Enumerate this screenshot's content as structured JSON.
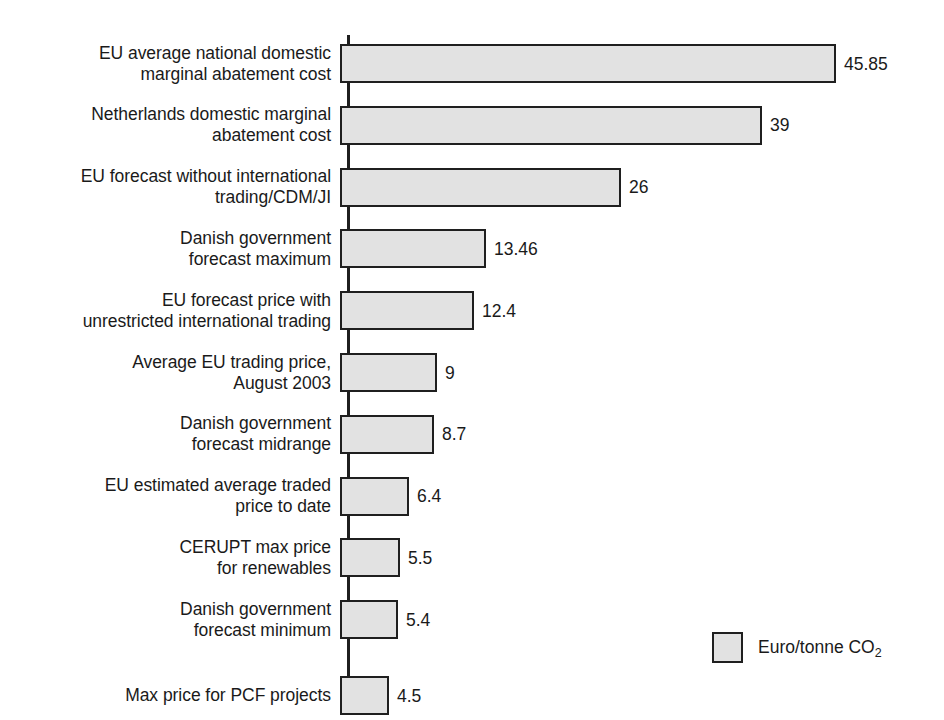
{
  "chart_data": {
    "type": "bar",
    "orientation": "horizontal",
    "title": "",
    "subtitle": "",
    "xlabel": "",
    "ylabel": "",
    "grid": false,
    "axis_line": "vertical-left",
    "xlim": [
      0,
      45.85
    ],
    "legend": {
      "position": "bottom-right",
      "entries": [
        {
          "label": "Euro/tonne CO",
          "sub": "2",
          "color": "#e2e2e2"
        }
      ]
    },
    "categories": [
      "EU average national domestic\nmarginal abatement cost",
      "Netherlands domestic marginal\nabatement cost",
      "EU forecast without international\ntrading/CDM/JI",
      "Danish government\nforecast maximum",
      "EU forecast price with\nunrestricted international trading",
      "Average EU trading price,\nAugust 2003",
      "Danish government\nforecast midrange",
      "EU estimated average traded\nprice to date",
      "CERUPT max price\nfor renewables",
      "Danish government\nforecast minimum",
      "Max price for PCF projects"
    ],
    "values": [
      45.85,
      39,
      26,
      13.46,
      12.4,
      9,
      8.7,
      6.4,
      5.5,
      5.4,
      4.5
    ],
    "value_labels": [
      "45.85",
      "39",
      "26",
      "13.46",
      "12.4",
      "9",
      "8.7",
      "6.4",
      "5.5",
      "5.4",
      "4.5"
    ],
    "series": [
      {
        "name": "Euro/tonne CO2",
        "values": [
          45.85,
          39,
          26,
          13.46,
          12.4,
          9,
          8.7,
          6.4,
          5.5,
          5.4,
          4.5
        ]
      }
    ]
  },
  "style": {
    "bar_fill": "#e2e2e2",
    "bar_stroke": "#1f1f1f",
    "text_color": "#1a1a1a",
    "background": "#ffffff"
  }
}
